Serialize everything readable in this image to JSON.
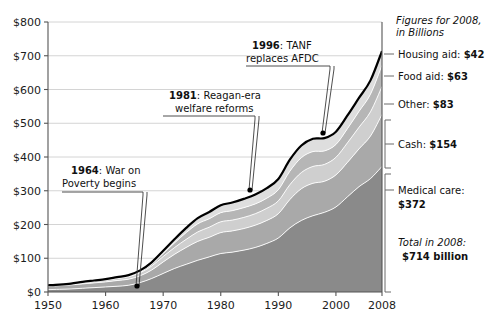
{
  "chart_data": {
    "type": "area",
    "stacked": true,
    "title": "",
    "subtitle": "",
    "xlabel": "",
    "ylabel": "",
    "xlim": [
      1950,
      2008
    ],
    "ylim": [
      0,
      800
    ],
    "grid": true,
    "legend_position": "right",
    "x_ticks": [
      "1950",
      "1960",
      "1970",
      "1980",
      "1990",
      "2000",
      "2008"
    ],
    "x_tick_values": [
      1950,
      1960,
      1970,
      1980,
      1990,
      2000,
      2008
    ],
    "y_ticks": [
      "$0",
      "$100",
      "$200",
      "$300",
      "$400",
      "$500",
      "$600",
      "$700",
      "$800"
    ],
    "y_tick_values": [
      0,
      100,
      200,
      300,
      400,
      500,
      600,
      700,
      800
    ],
    "x": [
      1950,
      1952,
      1954,
      1956,
      1958,
      1960,
      1962,
      1964,
      1966,
      1968,
      1970,
      1972,
      1974,
      1976,
      1978,
      1980,
      1982,
      1984,
      1986,
      1988,
      1990,
      1992,
      1994,
      1996,
      1998,
      2000,
      2002,
      2004,
      2006,
      2008
    ],
    "series": [
      {
        "name": "Medical care",
        "color": "#8a8a8a",
        "values": [
          7,
          8,
          9,
          11,
          13,
          15,
          17,
          20,
          28,
          40,
          55,
          70,
          82,
          94,
          104,
          114,
          118,
          124,
          132,
          144,
          160,
          190,
          212,
          226,
          236,
          252,
          282,
          312,
          336,
          372
        ]
      },
      {
        "name": "Cash",
        "color": "#a9a9a9",
        "values": [
          10,
          11,
          12,
          13,
          14,
          15,
          17,
          18,
          20,
          25,
          34,
          42,
          50,
          56,
          58,
          62,
          63,
          64,
          66,
          68,
          72,
          84,
          94,
          96,
          92,
          95,
          102,
          112,
          126,
          154
        ]
      },
      {
        "name": "Other",
        "color": "#cfcfcf",
        "values": [
          2,
          2,
          3,
          3,
          4,
          5,
          6,
          7,
          9,
          12,
          16,
          20,
          24,
          28,
          30,
          32,
          32,
          33,
          34,
          36,
          38,
          44,
          48,
          50,
          50,
          52,
          58,
          64,
          72,
          83
        ]
      },
      {
        "name": "Food aid",
        "color": "#b6b6b6",
        "values": [
          0,
          0,
          0,
          1,
          1,
          1,
          1,
          2,
          3,
          5,
          9,
          14,
          20,
          24,
          25,
          27,
          28,
          29,
          29,
          30,
          33,
          40,
          44,
          44,
          40,
          38,
          42,
          47,
          52,
          63
        ]
      },
      {
        "name": "Housing aid",
        "color": "#dedede",
        "values": [
          1,
          1,
          1,
          2,
          2,
          2,
          3,
          3,
          4,
          6,
          8,
          11,
          14,
          17,
          20,
          22,
          24,
          26,
          28,
          30,
          32,
          34,
          36,
          38,
          38,
          38,
          39,
          40,
          41,
          42
        ]
      }
    ],
    "totals": [
      20,
      22,
      25,
      30,
      34,
      38,
      44,
      50,
      64,
      88,
      122,
      157,
      190,
      219,
      237,
      257,
      265,
      276,
      289,
      308,
      335,
      392,
      434,
      454,
      456,
      475,
      523,
      575,
      627,
      714
    ],
    "annotations": [
      {
        "id": "1964",
        "year": "1964",
        "label": ": War on",
        "label_line2": "Poverty begins",
        "point_year": 1964,
        "point_value": 50
      },
      {
        "id": "1981",
        "year": "1981",
        "label": ": Reagan-era",
        "label_line2": "welfare reforms",
        "point_year": 1981,
        "point_value": 290
      },
      {
        "id": "1996",
        "year": "1996",
        "label": ": TANF",
        "label_line2": "replaces AFDC",
        "point_year": 1996,
        "point_value": 454
      }
    ]
  },
  "legend": {
    "heading_line1": "Figures for 2008,",
    "heading_line2": "in Billions",
    "items": [
      {
        "label": "Housing aid:",
        "value": "$42"
      },
      {
        "label": "Food aid:",
        "value": "$63"
      },
      {
        "label": "Other:",
        "value": "$83"
      },
      {
        "label": "Cash:",
        "value": "$154"
      },
      {
        "label": "Medical care:",
        "value": "$372"
      }
    ],
    "total_label": "Total in 2008:",
    "total_value": "$714 billion"
  }
}
